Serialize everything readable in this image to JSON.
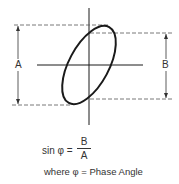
{
  "diagram": {
    "labels": {
      "a": "A",
      "b": "B"
    },
    "formula": {
      "lhs": "sin φ =",
      "numerator": "B",
      "denominator": "A"
    },
    "legend": "where φ = Phase Angle",
    "colors": {
      "stroke": "#1a1a1a",
      "dashed": "#555555",
      "text": "#333333"
    }
  }
}
